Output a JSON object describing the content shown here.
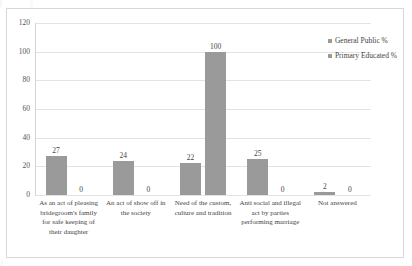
{
  "chart_data": {
    "type": "bar",
    "title": "",
    "subtitle": "",
    "xlabel": "",
    "ylabel": "",
    "ylim": [
      0,
      120
    ],
    "yticks": [
      0,
      20,
      40,
      60,
      80,
      100,
      120
    ],
    "grid": true,
    "legend_position": "top-right",
    "categories": [
      "As an act of pleasing bridegroom's family for safe keeping of their daughter",
      "An act of show off in the society",
      "Need of the custom, culture and tradition",
      "Anti social and illegal act by parties performing marriage",
      "Not answered"
    ],
    "series": [
      {
        "name": "General Public %",
        "color": "#9a9a9a",
        "values": [
          27,
          24,
          22,
          25,
          2
        ]
      },
      {
        "name": "Primary Educated %",
        "color": "#9a9a9a",
        "values": [
          0,
          0,
          100,
          0,
          0
        ]
      }
    ]
  }
}
